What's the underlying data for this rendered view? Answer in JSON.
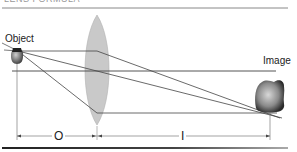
{
  "header": {
    "cropped_text": "LENS FORMULA"
  },
  "labels": {
    "object": "Object",
    "image": "Image",
    "object_distance": "O",
    "image_distance": "I"
  },
  "colors": {
    "lens_fill": "#c8c8c8",
    "lens_stroke": "#a8a8a8",
    "ray": "#444444",
    "axis": "#555555",
    "rule_top": "#888888",
    "rule_bottom": "#333333"
  }
}
